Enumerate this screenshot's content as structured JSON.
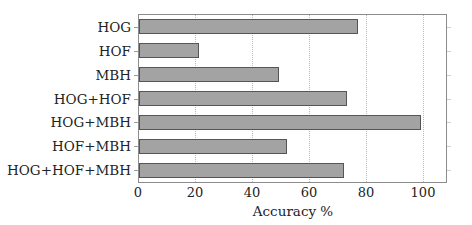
{
  "chart_data": {
    "type": "bar",
    "orientation": "horizontal",
    "title": "",
    "xlabel": "Accuracy %",
    "ylabel": "",
    "categories": [
      "HOG",
      "HOF",
      "MBH",
      "HOG+HOF",
      "HOG+MBH",
      "HOF+MBH",
      "HOG+HOF+MBH"
    ],
    "values": [
      77,
      21,
      49,
      73,
      99,
      52,
      72
    ],
    "xlim": [
      0,
      108.5
    ],
    "xticks": [
      0,
      20,
      40,
      60,
      80,
      100
    ],
    "xtick_labels": [
      "0",
      "20",
      "40",
      "60",
      "80",
      "100"
    ],
    "grid": {
      "x": true,
      "y": false,
      "style": "dotted"
    },
    "legend": null,
    "bar_color": "#a3a3a3",
    "bar_edge_color": "#555555"
  }
}
